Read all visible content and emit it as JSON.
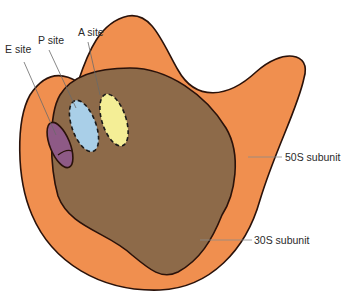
{
  "diagram": {
    "labels": {
      "e_site": "E site",
      "p_site": "P site",
      "a_site": "A site",
      "large_subunit": "50S subunit",
      "small_subunit": "30S subunit"
    },
    "colors": {
      "large_subunit": "#f08f4f",
      "small_subunit": "#8d6a49",
      "e_site": "#8e5a86",
      "p_site": "#a9cfe8",
      "a_site": "#f4ee96",
      "outline": "#2a120a",
      "leader": "#8a8a8a"
    }
  }
}
